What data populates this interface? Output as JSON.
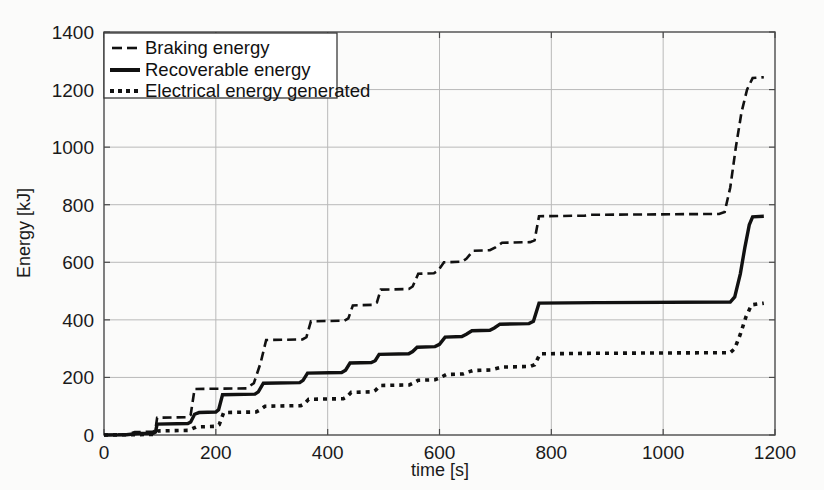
{
  "figure": {
    "background_color": "#fbfbfa",
    "ink_color": "#111111",
    "grid_color": "#b9b9b9"
  },
  "chart_data": {
    "type": "line",
    "title": "",
    "xlabel": "time [s]",
    "ylabel": "Energy [kJ]",
    "xlim": [
      0,
      1200
    ],
    "ylim": [
      0,
      1400
    ],
    "xticks": [
      0,
      200,
      400,
      600,
      800,
      1000,
      1200
    ],
    "yticks": [
      0,
      200,
      400,
      600,
      800,
      1000,
      1200,
      1400
    ],
    "grid": true,
    "legend_position": "upper-left-inside",
    "series": [
      {
        "name": "Braking energy",
        "style": "dashed",
        "final_value": 1240,
        "points": [
          [
            0,
            0
          ],
          [
            40,
            2
          ],
          [
            55,
            10
          ],
          [
            88,
            12
          ],
          [
            92,
            18
          ],
          [
            95,
            60
          ],
          [
            150,
            62
          ],
          [
            155,
            70
          ],
          [
            162,
            160
          ],
          [
            255,
            162
          ],
          [
            262,
            172
          ],
          [
            268,
            180
          ],
          [
            280,
            250
          ],
          [
            290,
            330
          ],
          [
            355,
            332
          ],
          [
            362,
            340
          ],
          [
            370,
            395
          ],
          [
            430,
            397
          ],
          [
            437,
            405
          ],
          [
            445,
            450
          ],
          [
            480,
            452
          ],
          [
            488,
            460
          ],
          [
            495,
            505
          ],
          [
            545,
            507
          ],
          [
            552,
            516
          ],
          [
            562,
            560
          ],
          [
            590,
            562
          ],
          [
            598,
            572
          ],
          [
            608,
            600
          ],
          [
            640,
            602
          ],
          [
            648,
            612
          ],
          [
            660,
            640
          ],
          [
            690,
            642
          ],
          [
            700,
            652
          ],
          [
            712,
            668
          ],
          [
            762,
            670
          ],
          [
            770,
            676
          ],
          [
            778,
            760
          ],
          [
            860,
            762
          ],
          [
            870,
            765
          ],
          [
            880,
            765
          ],
          [
            1100,
            768
          ],
          [
            1110,
            775
          ],
          [
            1120,
            860
          ],
          [
            1130,
            1000
          ],
          [
            1140,
            1120
          ],
          [
            1150,
            1200
          ],
          [
            1160,
            1240
          ],
          [
            1180,
            1243
          ]
        ]
      },
      {
        "name": "Recoverable energy",
        "style": "solid",
        "final_value": 760,
        "points": [
          [
            0,
            0
          ],
          [
            40,
            1
          ],
          [
            60,
            5
          ],
          [
            88,
            6
          ],
          [
            92,
            10
          ],
          [
            95,
            38
          ],
          [
            150,
            40
          ],
          [
            155,
            45
          ],
          [
            162,
            72
          ],
          [
            170,
            78
          ],
          [
            200,
            80
          ],
          [
            205,
            88
          ],
          [
            212,
            140
          ],
          [
            270,
            142
          ],
          [
            276,
            150
          ],
          [
            285,
            180
          ],
          [
            350,
            182
          ],
          [
            356,
            190
          ],
          [
            364,
            215
          ],
          [
            425,
            217
          ],
          [
            432,
            225
          ],
          [
            440,
            250
          ],
          [
            478,
            252
          ],
          [
            485,
            258
          ],
          [
            492,
            280
          ],
          [
            545,
            282
          ],
          [
            552,
            290
          ],
          [
            560,
            305
          ],
          [
            592,
            307
          ],
          [
            600,
            315
          ],
          [
            610,
            340
          ],
          [
            640,
            342
          ],
          [
            648,
            350
          ],
          [
            658,
            362
          ],
          [
            690,
            364
          ],
          [
            698,
            372
          ],
          [
            708,
            385
          ],
          [
            760,
            387
          ],
          [
            768,
            395
          ],
          [
            778,
            458
          ],
          [
            880,
            460
          ],
          [
            890,
            460
          ],
          [
            1120,
            462
          ],
          [
            1128,
            480
          ],
          [
            1138,
            560
          ],
          [
            1146,
            650
          ],
          [
            1154,
            730
          ],
          [
            1160,
            758
          ],
          [
            1180,
            760
          ]
        ]
      },
      {
        "name": "Electrical energy generated",
        "style": "dotted",
        "final_value": 460,
        "points": [
          [
            0,
            0
          ],
          [
            50,
            1
          ],
          [
            88,
            2
          ],
          [
            92,
            5
          ],
          [
            96,
            14
          ],
          [
            150,
            16
          ],
          [
            156,
            20
          ],
          [
            165,
            28
          ],
          [
            200,
            30
          ],
          [
            206,
            36
          ],
          [
            214,
            78
          ],
          [
            272,
            80
          ],
          [
            278,
            86
          ],
          [
            288,
            100
          ],
          [
            352,
            102
          ],
          [
            358,
            108
          ],
          [
            366,
            124
          ],
          [
            428,
            126
          ],
          [
            434,
            132
          ],
          [
            442,
            148
          ],
          [
            480,
            150
          ],
          [
            486,
            156
          ],
          [
            494,
            172
          ],
          [
            546,
            174
          ],
          [
            553,
            180
          ],
          [
            562,
            190
          ],
          [
            592,
            192
          ],
          [
            600,
            198
          ],
          [
            612,
            210
          ],
          [
            642,
            212
          ],
          [
            650,
            218
          ],
          [
            660,
            224
          ],
          [
            692,
            226
          ],
          [
            700,
            230
          ],
          [
            712,
            236
          ],
          [
            762,
            238
          ],
          [
            770,
            244
          ],
          [
            780,
            282
          ],
          [
            880,
            284
          ],
          [
            890,
            284
          ],
          [
            1120,
            286
          ],
          [
            1128,
            300
          ],
          [
            1138,
            350
          ],
          [
            1148,
            410
          ],
          [
            1158,
            452
          ],
          [
            1180,
            458
          ]
        ]
      }
    ]
  },
  "legend": {
    "items": [
      {
        "label": "Braking energy",
        "style": "dashed"
      },
      {
        "label": "Recoverable energy",
        "style": "solid"
      },
      {
        "label": "Electrical energy generated",
        "style": "dotted"
      }
    ]
  },
  "axes": {
    "x_tick_labels": [
      "0",
      "200",
      "400",
      "600",
      "800",
      "1000",
      "1200"
    ],
    "y_tick_labels": [
      "0",
      "200",
      "400",
      "600",
      "800",
      "1000",
      "1200",
      "1400"
    ],
    "x_title": "time [s]",
    "y_title": "Energy [kJ]"
  }
}
